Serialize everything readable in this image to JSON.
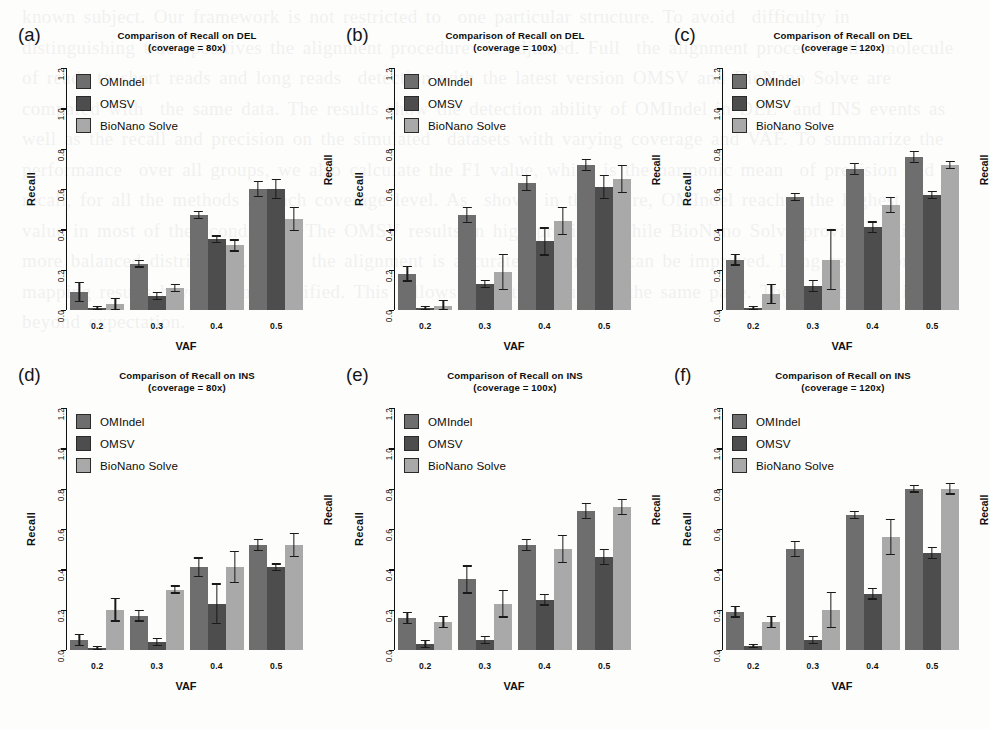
{
  "figure": {
    "ylabel": "Recall",
    "xlabel": "VAF",
    "y_ticks": [
      "0.0",
      "0.2",
      "0.4",
      "0.6",
      "0.8",
      "1.0",
      "1.2"
    ],
    "x_ticks": [
      "0.2",
      "0.3",
      "0.4",
      "0.5"
    ],
    "series_names": [
      "OMIndel",
      "OMSV",
      "BioNano Solve"
    ],
    "colors": {
      "OMIndel": "#6e6e6e",
      "OMSV": "#4d4d4d",
      "BioNano Solve": "#a9a9a9",
      "axis": "#111111",
      "background": "#fdfdfc"
    }
  },
  "bleed_text": "known subject. Our framework is not restricted to  one particular structure. To avoid  difficulty in distinguishing true  positives the alignment procedure  is adjusted. Full  the alignment process in the molecule  of reads to short reads and long reads  detection with the latest version OMSV and BioNano Solve are compared with  the same data. The results show the detection ability of OMIndel in DEL  and INS events as well as the recall and precision on the simulated  datasets with varying coverage and VAF. To summarize the performance  over all groups, we also calculate the F1 value, which is the harmonic mean  of precision and recall, for all the methods at each coverage level. As  shown in the figure, OMIndel reaches the highest F1 value in most of the  conditions. The OMSV results in high precision while BioNano Solve provides  slightly more balanced distribution. While the alignment is accurate, the  recall can be improved. Long reads from the mapping results have  been simplified. This follows from the figure on the same page. The result  here is not beyond expectation.",
  "panels": [
    {
      "letter": "(a)",
      "title_line1": "Comparison of Recall on DEL",
      "title_line2": "(coverage = 80x)",
      "chart_data": {
        "type": "bar",
        "title": "Comparison of Recall on DEL (coverage = 80x)",
        "xlabel": "VAF",
        "ylabel": "Recall",
        "ylim": [
          0.0,
          1.2
        ],
        "grid": false,
        "legend_position": "top-left",
        "categories": [
          "0.2",
          "0.3",
          "0.4",
          "0.5"
        ],
        "series": [
          {
            "name": "OMIndel",
            "values": [
              0.09,
              0.23,
              0.47,
              0.6
            ],
            "errors": [
              0.05,
              0.02,
              0.02,
              0.04
            ]
          },
          {
            "name": "OMSV",
            "values": [
              0.01,
              0.07,
              0.35,
              0.6
            ],
            "errors": [
              0.01,
              0.02,
              0.02,
              0.05
            ]
          },
          {
            "name": "BioNano Solve",
            "values": [
              0.03,
              0.11,
              0.32,
              0.45
            ],
            "errors": [
              0.03,
              0.02,
              0.03,
              0.06
            ]
          }
        ]
      }
    },
    {
      "letter": "(b)",
      "title_line1": "Comparison of Recall on DEL",
      "title_line2": "(coverage = 100x)",
      "chart_data": {
        "type": "bar",
        "title": "Comparison of Recall on DEL (coverage = 100x)",
        "xlabel": "VAF",
        "ylabel": "Recall",
        "ylim": [
          0.0,
          1.2
        ],
        "grid": false,
        "legend_position": "top-left",
        "categories": [
          "0.2",
          "0.3",
          "0.4",
          "0.5"
        ],
        "series": [
          {
            "name": "OMIndel",
            "values": [
              0.18,
              0.47,
              0.63,
              0.72
            ],
            "errors": [
              0.04,
              0.04,
              0.04,
              0.03
            ]
          },
          {
            "name": "OMSV",
            "values": [
              0.01,
              0.13,
              0.34,
              0.61
            ],
            "errors": [
              0.01,
              0.02,
              0.07,
              0.06
            ]
          },
          {
            "name": "BioNano Solve",
            "values": [
              0.02,
              0.19,
              0.44,
              0.65
            ],
            "errors": [
              0.03,
              0.09,
              0.07,
              0.07
            ]
          }
        ]
      }
    },
    {
      "letter": "(c)",
      "title_line1": "Comparison of Recall on DEL",
      "title_line2": "(coverage = 120x)",
      "chart_data": {
        "type": "bar",
        "title": "Comparison of Recall on DEL (coverage = 120x)",
        "xlabel": "VAF",
        "ylabel": "Recall",
        "ylim": [
          0.0,
          1.2
        ],
        "grid": false,
        "legend_position": "top-left",
        "categories": [
          "0.2",
          "0.3",
          "0.4",
          "0.5"
        ],
        "series": [
          {
            "name": "OMIndel",
            "values": [
              0.25,
              0.56,
              0.7,
              0.76
            ],
            "errors": [
              0.03,
              0.02,
              0.03,
              0.03
            ]
          },
          {
            "name": "OMSV",
            "values": [
              0.01,
              0.12,
              0.41,
              0.57
            ],
            "errors": [
              0.01,
              0.03,
              0.03,
              0.02
            ]
          },
          {
            "name": "BioNano Solve",
            "values": [
              0.08,
              0.25,
              0.52,
              0.72
            ],
            "errors": [
              0.05,
              0.15,
              0.04,
              0.02
            ]
          }
        ]
      }
    },
    {
      "letter": "(d)",
      "title_line1": "Comparison of Recall on INS",
      "title_line2": "(coverage = 80x)",
      "chart_data": {
        "type": "bar",
        "title": "Comparison of Recall on INS (coverage = 80x)",
        "xlabel": "VAF",
        "ylabel": "Recall",
        "ylim": [
          0.0,
          1.2
        ],
        "grid": false,
        "legend_position": "top-left",
        "categories": [
          "0.2",
          "0.3",
          "0.4",
          "0.5"
        ],
        "series": [
          {
            "name": "OMIndel",
            "values": [
              0.05,
              0.17,
              0.41,
              0.52
            ],
            "errors": [
              0.03,
              0.03,
              0.05,
              0.03
            ]
          },
          {
            "name": "OMSV",
            "values": [
              0.01,
              0.04,
              0.23,
              0.41
            ],
            "errors": [
              0.01,
              0.02,
              0.1,
              0.02
            ]
          },
          {
            "name": "BioNano Solve",
            "values": [
              0.2,
              0.3,
              0.41,
              0.52
            ],
            "errors": [
              0.06,
              0.02,
              0.08,
              0.06
            ]
          }
        ]
      }
    },
    {
      "letter": "(e)",
      "title_line1": "Comparison of Recall on INS",
      "title_line2": "(coverage = 100x)",
      "chart_data": {
        "type": "bar",
        "title": "Comparison of Recall on INS (coverage = 100x)",
        "xlabel": "VAF",
        "ylabel": "Recall",
        "ylim": [
          0.0,
          1.2
        ],
        "grid": false,
        "legend_position": "top-left",
        "categories": [
          "0.2",
          "0.3",
          "0.4",
          "0.5"
        ],
        "series": [
          {
            "name": "OMIndel",
            "values": [
              0.16,
              0.35,
              0.52,
              0.69
            ],
            "errors": [
              0.03,
              0.07,
              0.03,
              0.04
            ]
          },
          {
            "name": "OMSV",
            "values": [
              0.03,
              0.05,
              0.25,
              0.46
            ],
            "errors": [
              0.02,
              0.02,
              0.03,
              0.04
            ]
          },
          {
            "name": "BioNano Solve",
            "values": [
              0.14,
              0.23,
              0.5,
              0.71
            ],
            "errors": [
              0.03,
              0.07,
              0.07,
              0.04
            ]
          }
        ]
      }
    },
    {
      "letter": "(f)",
      "title_line1": "Comparison of Recall on INS",
      "title_line2": "(coverage = 120x)",
      "chart_data": {
        "type": "bar",
        "title": "Comparison of Recall on INS (coverage = 120x)",
        "xlabel": "VAF",
        "ylabel": "Recall",
        "ylim": [
          0.0,
          1.2
        ],
        "grid": false,
        "legend_position": "top-left",
        "categories": [
          "0.2",
          "0.3",
          "0.4",
          "0.5"
        ],
        "series": [
          {
            "name": "OMIndel",
            "values": [
              0.19,
              0.5,
              0.67,
              0.8
            ],
            "errors": [
              0.03,
              0.04,
              0.02,
              0.02
            ]
          },
          {
            "name": "OMSV",
            "values": [
              0.02,
              0.05,
              0.28,
              0.48
            ],
            "errors": [
              0.01,
              0.02,
              0.03,
              0.03
            ]
          },
          {
            "name": "BioNano Solve",
            "values": [
              0.14,
              0.2,
              0.56,
              0.8
            ],
            "errors": [
              0.03,
              0.09,
              0.09,
              0.03
            ]
          }
        ]
      }
    }
  ]
}
